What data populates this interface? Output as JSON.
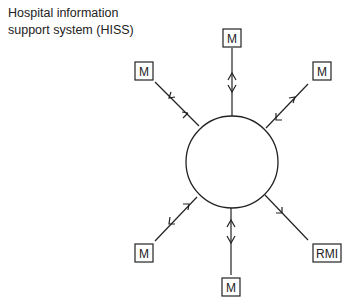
{
  "title": {
    "line1": "Hospital information",
    "line2": "support system (HISS)"
  },
  "hub": {
    "label": "",
    "shape": "circle"
  },
  "nodes": [
    {
      "id": "top",
      "label": "M",
      "arrows": "bidirectional"
    },
    {
      "id": "top-left",
      "label": "M",
      "arrows": "bidirectional"
    },
    {
      "id": "top-right",
      "label": "M",
      "arrows": "bidirectional"
    },
    {
      "id": "bottom-left",
      "label": "M",
      "arrows": "bidirectional"
    },
    {
      "id": "bottom",
      "label": "M",
      "arrows": "bidirectional"
    },
    {
      "id": "bottom-right",
      "label": "RMI",
      "arrows": "outward"
    }
  ],
  "colors": {
    "stroke": "#222222",
    "background": "#ffffff"
  }
}
